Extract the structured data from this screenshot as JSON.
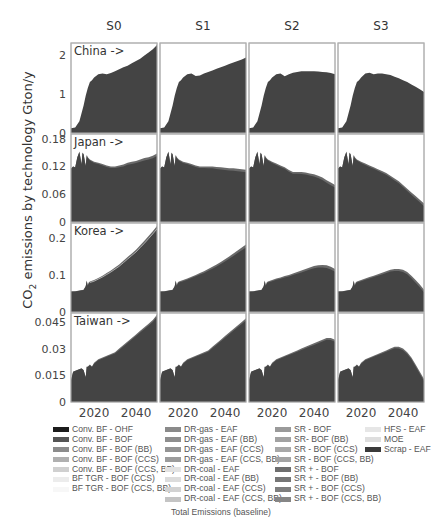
{
  "chart_data": {
    "type": "area",
    "title": "",
    "ylabel": "CO2 emissions by technology Gton/y",
    "ylabel_parts": {
      "pre": "CO",
      "sub": "2",
      "post": " emissions by technology Gton/y"
    },
    "xlabel": "",
    "caption": "Total Emissions (baseline)",
    "x_range": [
      2009,
      2050
    ],
    "x_ticks": [
      2020,
      2040
    ],
    "columns": [
      "S0",
      "S1",
      "S2",
      "S3"
    ],
    "rows": [
      {
        "label": "China ->",
        "ylim": [
          0,
          2.3
        ],
        "yticks": [
          0,
          1,
          2
        ],
        "ytick_labels": [
          "0",
          "1",
          "2"
        ],
        "x": [
          2009,
          2011,
          2013,
          2015,
          2016,
          2017,
          2018,
          2019,
          2020,
          2022,
          2024,
          2026,
          2028,
          2030,
          2032,
          2034,
          2036,
          2038,
          2040,
          2042,
          2044,
          2046,
          2048,
          2050
        ],
        "series_total": {
          "S0": [
            0.12,
            0.14,
            0.3,
            0.7,
            0.95,
            1.15,
            1.3,
            1.35,
            1.42,
            1.5,
            1.52,
            1.5,
            1.53,
            1.58,
            1.63,
            1.68,
            1.72,
            1.78,
            1.84,
            1.9,
            1.98,
            2.06,
            2.14,
            2.25
          ],
          "S1": [
            0.12,
            0.14,
            0.3,
            0.7,
            0.95,
            1.15,
            1.3,
            1.35,
            1.42,
            1.5,
            1.52,
            1.46,
            1.47,
            1.52,
            1.56,
            1.6,
            1.64,
            1.68,
            1.72,
            1.76,
            1.8,
            1.84,
            1.88,
            1.93
          ],
          "S2": [
            0.12,
            0.14,
            0.3,
            0.7,
            0.95,
            1.15,
            1.3,
            1.35,
            1.42,
            1.5,
            1.52,
            1.45,
            1.5,
            1.54,
            1.56,
            1.58,
            1.58,
            1.58,
            1.58,
            1.57,
            1.56,
            1.55,
            1.53,
            1.5
          ],
          "S3": [
            0.12,
            0.14,
            0.3,
            0.7,
            0.95,
            1.15,
            1.3,
            1.35,
            1.42,
            1.52,
            1.54,
            1.5,
            1.52,
            1.52,
            1.5,
            1.48,
            1.44,
            1.4,
            1.35,
            1.3,
            1.24,
            1.18,
            1.12,
            1.05
          ]
        }
      },
      {
        "label": "Japan ->",
        "ylim": [
          0,
          0.19
        ],
        "yticks": [
          0,
          0.06,
          0.12,
          0.18
        ],
        "ytick_labels": [
          "0",
          "0.06",
          "0.12",
          "0.18"
        ],
        "x": [
          2009,
          2010,
          2011,
          2012,
          2013,
          2014,
          2014.5,
          2015,
          2016,
          2016.5,
          2017,
          2018,
          2020,
          2022,
          2024,
          2026,
          2028,
          2030,
          2032,
          2034,
          2036,
          2038,
          2040,
          2042,
          2044,
          2046,
          2048,
          2050
        ],
        "series_total": {
          "S0": [
            0.115,
            0.12,
            0.118,
            0.14,
            0.152,
            0.125,
            0.15,
            0.147,
            0.122,
            0.145,
            0.14,
            0.135,
            0.13,
            0.128,
            0.125,
            0.122,
            0.12,
            0.12,
            0.122,
            0.124,
            0.128,
            0.13,
            0.132,
            0.135,
            0.138,
            0.14,
            0.143,
            0.148
          ],
          "S1": [
            0.115,
            0.12,
            0.118,
            0.14,
            0.152,
            0.125,
            0.15,
            0.147,
            0.122,
            0.145,
            0.14,
            0.135,
            0.13,
            0.128,
            0.125,
            0.122,
            0.12,
            0.12,
            0.12,
            0.12,
            0.119,
            0.118,
            0.117,
            0.116,
            0.116,
            0.115,
            0.114,
            0.113
          ],
          "S2": [
            0.115,
            0.12,
            0.118,
            0.14,
            0.152,
            0.125,
            0.15,
            0.147,
            0.122,
            0.145,
            0.14,
            0.135,
            0.13,
            0.126,
            0.122,
            0.118,
            0.112,
            0.108,
            0.108,
            0.108,
            0.107,
            0.105,
            0.103,
            0.1,
            0.096,
            0.09,
            0.085,
            0.08
          ],
          "S3": [
            0.115,
            0.12,
            0.118,
            0.14,
            0.152,
            0.125,
            0.15,
            0.147,
            0.122,
            0.145,
            0.14,
            0.135,
            0.13,
            0.126,
            0.122,
            0.118,
            0.114,
            0.11,
            0.106,
            0.1,
            0.094,
            0.088,
            0.08,
            0.072,
            0.064,
            0.056,
            0.048,
            0.04
          ]
        },
        "band_top_offset": 0.006
      },
      {
        "label": "Korea ->",
        "ylim": [
          0,
          0.24
        ],
        "yticks": [
          0,
          0.1,
          0.2
        ],
        "ytick_labels": [
          "0",
          "0.1",
          "0.2"
        ],
        "x": [
          2009,
          2011,
          2013,
          2015,
          2016,
          2016.5,
          2017,
          2017.5,
          2018,
          2020,
          2022,
          2024,
          2026,
          2028,
          2030,
          2032,
          2034,
          2036,
          2038,
          2040,
          2042,
          2044,
          2046,
          2048,
          2050
        ],
        "series_total": {
          "S0": [
            0.055,
            0.056,
            0.058,
            0.06,
            0.07,
            0.085,
            0.072,
            0.08,
            0.082,
            0.086,
            0.092,
            0.098,
            0.105,
            0.112,
            0.12,
            0.128,
            0.138,
            0.148,
            0.158,
            0.168,
            0.18,
            0.192,
            0.205,
            0.218,
            0.232
          ],
          "S1": [
            0.055,
            0.056,
            0.058,
            0.06,
            0.07,
            0.085,
            0.072,
            0.08,
            0.082,
            0.086,
            0.09,
            0.095,
            0.1,
            0.105,
            0.11,
            0.116,
            0.122,
            0.128,
            0.135,
            0.142,
            0.15,
            0.158,
            0.166,
            0.174,
            0.182
          ],
          "S2": [
            0.055,
            0.056,
            0.058,
            0.06,
            0.07,
            0.085,
            0.072,
            0.08,
            0.082,
            0.086,
            0.09,
            0.093,
            0.097,
            0.1,
            0.104,
            0.108,
            0.112,
            0.116,
            0.12,
            0.124,
            0.126,
            0.127,
            0.126,
            0.122,
            0.116
          ],
          "S3": [
            0.055,
            0.056,
            0.058,
            0.06,
            0.07,
            0.085,
            0.072,
            0.08,
            0.082,
            0.086,
            0.09,
            0.094,
            0.098,
            0.102,
            0.106,
            0.11,
            0.114,
            0.116,
            0.116,
            0.114,
            0.108,
            0.098,
            0.086,
            0.074,
            0.06
          ]
        },
        "band_top_offset": 0.008
      },
      {
        "label": "Taiwan ->",
        "ylim": [
          0,
          0.05
        ],
        "yticks": [
          0,
          0.015,
          0.03,
          0.045
        ],
        "ytick_labels": [
          "0",
          "0.015",
          "0.03",
          "0.045"
        ],
        "x": [
          2009,
          2010,
          2012,
          2014,
          2015,
          2016,
          2016.5,
          2017,
          2018,
          2019,
          2020,
          2022,
          2024,
          2026,
          2028,
          2030,
          2032,
          2034,
          2036,
          2038,
          2040,
          2042,
          2044,
          2046,
          2048,
          2050
        ],
        "series_total": {
          "S0": [
            0.012,
            0.017,
            0.018,
            0.019,
            0.018,
            0.014,
            0.02,
            0.02,
            0.021,
            0.02,
            0.022,
            0.024,
            0.025,
            0.026,
            0.027,
            0.028,
            0.03,
            0.032,
            0.034,
            0.036,
            0.038,
            0.04,
            0.042,
            0.044,
            0.046,
            0.049
          ],
          "S1": [
            0.012,
            0.017,
            0.018,
            0.019,
            0.018,
            0.014,
            0.02,
            0.02,
            0.021,
            0.02,
            0.022,
            0.024,
            0.025,
            0.026,
            0.027,
            0.028,
            0.029,
            0.031,
            0.033,
            0.035,
            0.037,
            0.039,
            0.041,
            0.043,
            0.045,
            0.047
          ],
          "S2": [
            0.012,
            0.017,
            0.018,
            0.019,
            0.018,
            0.014,
            0.02,
            0.02,
            0.021,
            0.02,
            0.022,
            0.024,
            0.025,
            0.026,
            0.027,
            0.028,
            0.029,
            0.03,
            0.031,
            0.032,
            0.033,
            0.034,
            0.035,
            0.036,
            0.036,
            0.035
          ],
          "S3": [
            0.012,
            0.017,
            0.018,
            0.019,
            0.018,
            0.014,
            0.02,
            0.02,
            0.021,
            0.02,
            0.022,
            0.024,
            0.025,
            0.026,
            0.027,
            0.028,
            0.029,
            0.03,
            0.031,
            0.031,
            0.03,
            0.028,
            0.025,
            0.021,
            0.017,
            0.013
          ]
        },
        "band_top_offset": 0.0012
      }
    ],
    "legend": {
      "position": "bottom",
      "columns": [
        [
          {
            "label": "Conv. BF - OHF",
            "color": "#1c1c1c"
          },
          {
            "label": "Conv. BF - BOF",
            "color": "#555555"
          },
          {
            "label": "Conv. BF - BOF (BB)",
            "color": "#8c8c8c"
          },
          {
            "label": "Conv. BF - BOF (CCS)",
            "color": "#b0b0b0"
          },
          {
            "label": "Conv. BF - BOF (CCS, BB)",
            "color": "#d0d0d0"
          },
          {
            "label": "BF TGR - BOF (CCS)",
            "color": "#ececec"
          },
          {
            "label": "BF TGR - BOF (CCS, BB)",
            "color": "#f7f7f7"
          }
        ],
        [
          {
            "label": "DR-gas - EAF",
            "color": "#8a8a8a"
          },
          {
            "label": "DR-gas - EAF (BB)",
            "color": "#8e8e8e"
          },
          {
            "label": "DR-gas - EAF (CCS)",
            "color": "#949494"
          },
          {
            "label": "DR-gas - EAF (CCS, BB)",
            "color": "#9c9c9c"
          },
          {
            "label": "DR-coal - EAF",
            "color": "#e2e2e2"
          },
          {
            "label": "DR-coal - EAF (BB)",
            "color": "#dcdcdc"
          },
          {
            "label": "DR-coal - EAF (CCS)",
            "color": "#d2d2d2"
          },
          {
            "label": "DR-coal - EAF (CCS, BB)",
            "color": "#c4c4c4"
          }
        ],
        [
          {
            "label": "SR - BOF",
            "color": "#9a9a9a"
          },
          {
            "label": "SR- BOF (BB)",
            "color": "#a2a2a2"
          },
          {
            "label": "SR - BOF (CCS)",
            "color": "#a8a8a8"
          },
          {
            "label": "SR - BOF (CCS, BB)",
            "color": "#a4a4a4"
          },
          {
            "label": "SR + - BOF",
            "color": "#6e6e6e"
          },
          {
            "label": "SR + - BOF (BB)",
            "color": "#767676"
          },
          {
            "label": "SR + - BOF (CCS)",
            "color": "#7e7e7e"
          },
          {
            "label": "SR + - BOF (CCS, BB)",
            "color": "#868686"
          }
        ],
        [
          {
            "label": "HFS - EAF",
            "color": "#e6e6e6"
          },
          {
            "label": "MOE",
            "color": "#dedede"
          },
          {
            "label": "Scrap - EAF",
            "color": "#3a3a3a"
          }
        ]
      ]
    },
    "grid": false,
    "colors": {
      "main_fill": "#444444",
      "band_fill": "#6a6a6a",
      "band_line": "#bdbdbd",
      "axis": "#b0b0b0"
    }
  }
}
